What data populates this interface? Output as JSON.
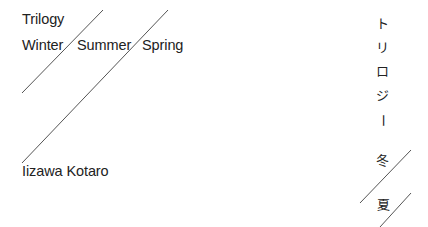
{
  "en": {
    "series": "Trilogy",
    "titles": [
      "Winter",
      "Summer",
      "Spring"
    ],
    "author": "Iizawa Kotaro"
  },
  "ja": {
    "series_chars": [
      "ト",
      "リ",
      "ロ",
      "ジ",
      "ー"
    ],
    "titles": [
      "冬",
      "夏"
    ]
  },
  "colors": {
    "text": "#222222",
    "line": "#444444",
    "background": "#ffffff"
  }
}
